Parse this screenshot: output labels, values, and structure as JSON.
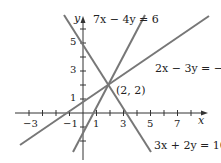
{
  "diagram": {
    "type": "coordinate-plane-lines",
    "axes": {
      "x_label": "x",
      "y_label": "y",
      "x_tick_labels": [
        "-3",
        "-1",
        "1",
        "3",
        "5",
        "7"
      ],
      "y_tick_labels": [
        "1",
        "3",
        "5"
      ]
    },
    "lines": [
      {
        "equation": "7x − 4y = 6",
        "color": "#777777"
      },
      {
        "equation": "2x − 3y = −2",
        "color": "#777777"
      },
      {
        "equation": "3x + 2y = 10",
        "color": "#777777"
      }
    ],
    "intersection": {
      "label": "(2, 2)"
    }
  },
  "labels": {
    "line1": "7x − 4y = 6",
    "line2": "2x − 3y = −2",
    "line3": "3x + 2y = 10",
    "point": "(2, 2)",
    "x_axis": "x",
    "y_axis": "y",
    "xt_m3": "−3",
    "xt_m1": "−1",
    "xt_1": "1",
    "xt_3": "3",
    "xt_5": "5",
    "xt_7": "7",
    "yt_1": "1",
    "yt_3": "3",
    "yt_5": "5"
  }
}
